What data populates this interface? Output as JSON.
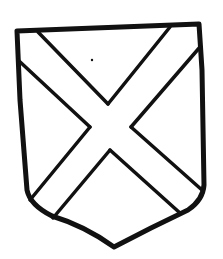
{
  "figure": {
    "ink_color": "#111111",
    "field_color": "#ffffff"
  }
}
